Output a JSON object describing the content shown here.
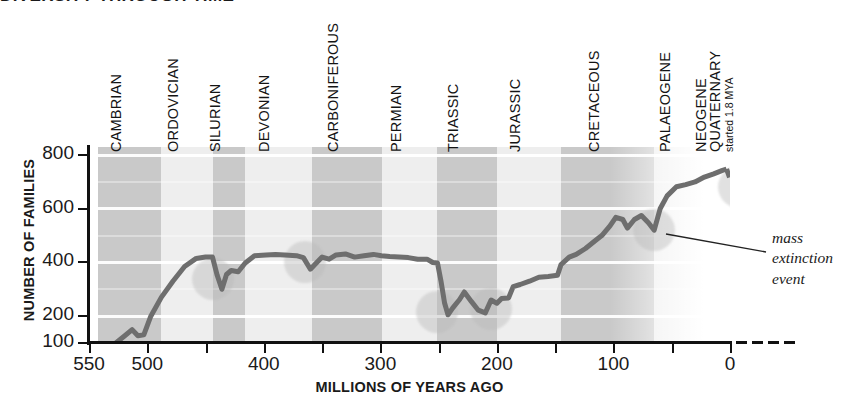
{
  "title": "DIVERSITY THROUGH TIME",
  "axes": {
    "y_title": "NUMBER OF FAMILIES",
    "x_title": "MILLIONS OF YEARS AGO",
    "y_ticks": [
      800,
      600,
      400,
      200,
      100
    ],
    "x_ticks": [
      550,
      500,
      450,
      400,
      350,
      300,
      250,
      200,
      150,
      100,
      50,
      0
    ],
    "x_tick_labels": [
      550,
      500,
      400,
      300,
      200,
      100,
      0
    ]
  },
  "annotation": {
    "line1": "mass",
    "line2": "extinction",
    "line3": "event"
  },
  "periods": [
    {
      "name": "CAMBRIAN",
      "start": 542,
      "end": 488,
      "shaded": true
    },
    {
      "name": "ORDOVICIAN",
      "start": 488,
      "end": 444,
      "shaded": false
    },
    {
      "name": "SILURIAN",
      "start": 444,
      "end": 416,
      "shaded": true
    },
    {
      "name": "DEVONIAN",
      "start": 416,
      "end": 359,
      "shaded": false
    },
    {
      "name": "CARBONIFEROUS",
      "start": 359,
      "end": 299,
      "shaded": true
    },
    {
      "name": "PERMIAN",
      "start": 299,
      "end": 251,
      "shaded": false
    },
    {
      "name": "TRIASSIC",
      "start": 251,
      "end": 200,
      "shaded": true
    },
    {
      "name": "JURASSIC",
      "start": 200,
      "end": 145,
      "shaded": false
    },
    {
      "name": "CRETACEOUS",
      "start": 145,
      "end": 65,
      "shaded": true
    },
    {
      "name": "PALAEOGENE",
      "start": 65,
      "end": 23,
      "shaded": false
    },
    {
      "name": "NEOGENE",
      "start": 23,
      "end": 2,
      "shaded": true
    },
    {
      "name": "QUATERNARY",
      "start": 2,
      "end": 0,
      "shaded": false,
      "sub": "started 1.8 MYA"
    }
  ],
  "chart_data": {
    "type": "line",
    "title": "DIVERSITY THROUGH TIME",
    "xlabel": "MILLIONS OF YEARS AGO",
    "ylabel": "NUMBER OF FAMILIES",
    "xlim": [
      550,
      0
    ],
    "ylim": [
      100,
      830
    ],
    "x_reversed": true,
    "grid": "horizontal-white-bands",
    "legend": "none",
    "series": [
      {
        "name": "Number of marine/animal families",
        "style": "solid",
        "points": [
          [
            527,
            100
          ],
          [
            519,
            128
          ],
          [
            513,
            150
          ],
          [
            508,
            127
          ],
          [
            503,
            130
          ],
          [
            497,
            200
          ],
          [
            488,
            270
          ],
          [
            478,
            330
          ],
          [
            468,
            385
          ],
          [
            458,
            415
          ],
          [
            450,
            420
          ],
          [
            444,
            420
          ],
          [
            440,
            352
          ],
          [
            436,
            300
          ],
          [
            432,
            355
          ],
          [
            428,
            370
          ],
          [
            422,
            365
          ],
          [
            416,
            398
          ],
          [
            408,
            425
          ],
          [
            398,
            428
          ],
          [
            390,
            430
          ],
          [
            382,
            428
          ],
          [
            372,
            425
          ],
          [
            366,
            418
          ],
          [
            360,
            375
          ],
          [
            355,
            398
          ],
          [
            350,
            420
          ],
          [
            344,
            412
          ],
          [
            338,
            428
          ],
          [
            330,
            432
          ],
          [
            322,
            420
          ],
          [
            314,
            425
          ],
          [
            306,
            430
          ],
          [
            299,
            425
          ],
          [
            292,
            422
          ],
          [
            284,
            420
          ],
          [
            276,
            418
          ],
          [
            268,
            412
          ],
          [
            260,
            412
          ],
          [
            255,
            400
          ],
          [
            251,
            398
          ],
          [
            248,
            330
          ],
          [
            245,
            250
          ],
          [
            242,
            205
          ],
          [
            238,
            230
          ],
          [
            232,
            262
          ],
          [
            228,
            290
          ],
          [
            222,
            255
          ],
          [
            216,
            222
          ],
          [
            210,
            212
          ],
          [
            205,
            260
          ],
          [
            200,
            248
          ],
          [
            196,
            266
          ],
          [
            190,
            268
          ],
          [
            186,
            310
          ],
          [
            180,
            318
          ],
          [
            172,
            330
          ],
          [
            164,
            345
          ],
          [
            156,
            348
          ],
          [
            148,
            352
          ],
          [
            145,
            392
          ],
          [
            138,
            420
          ],
          [
            132,
            430
          ],
          [
            124,
            452
          ],
          [
            116,
            480
          ],
          [
            110,
            500
          ],
          [
            103,
            536
          ],
          [
            98,
            568
          ],
          [
            92,
            560
          ],
          [
            88,
            528
          ],
          [
            82,
            560
          ],
          [
            76,
            575
          ],
          [
            70,
            548
          ],
          [
            65,
            520
          ],
          [
            60,
            600
          ],
          [
            54,
            648
          ],
          [
            46,
            682
          ],
          [
            38,
            690
          ],
          [
            30,
            700
          ],
          [
            22,
            718
          ],
          [
            14,
            730
          ],
          [
            7,
            742
          ],
          [
            3,
            748
          ]
        ]
      },
      {
        "name": "Recent decline (projected)",
        "style": "dashed",
        "points": [
          [
            3,
            748
          ],
          [
            0,
            712
          ],
          [
            -6,
            672
          ],
          [
            -12,
            640
          ]
        ]
      }
    ],
    "mass_extinction_markers": [
      {
        "label": "End-Ordovician",
        "x": 444,
        "y": 340
      },
      {
        "label": "Late Devonian",
        "x": 365,
        "y": 400
      },
      {
        "label": "End-Permian",
        "x": 251,
        "y": 215
      },
      {
        "label": "End-Triassic",
        "x": 205,
        "y": 228
      },
      {
        "label": "End-Cretaceous",
        "x": 65,
        "y": 520
      },
      {
        "label": "Present day",
        "x": -8,
        "y": 680
      }
    ]
  }
}
